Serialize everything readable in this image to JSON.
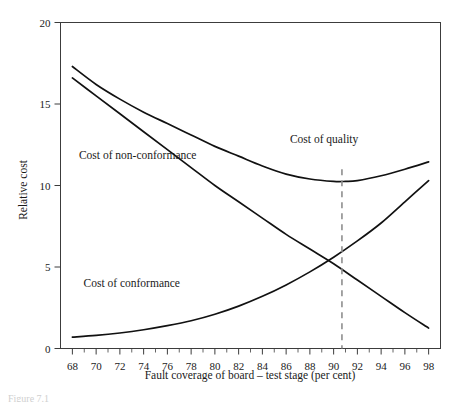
{
  "figure": {
    "caption_fragment": "Figure 7.1"
  },
  "chart_data": {
    "type": "line",
    "title": "",
    "xlabel": "Fault coverage of board – test stage (per cent)",
    "ylabel": "Relative cost",
    "xlim": [
      67,
      99
    ],
    "ylim": [
      0,
      20
    ],
    "xticks": [
      68,
      70,
      72,
      74,
      76,
      78,
      80,
      82,
      84,
      86,
      88,
      90,
      92,
      94,
      96,
      98
    ],
    "xtick_labels": [
      "68",
      "70",
      "72",
      "74",
      "76",
      "78",
      "80",
      "82",
      "84",
      "86",
      "88",
      "90",
      "92",
      "94",
      "96",
      "98"
    ],
    "yticks": [
      0,
      5,
      10,
      15,
      20
    ],
    "ytick_labels": [
      "0",
      "5",
      "10",
      "15",
      "20"
    ],
    "grid": false,
    "legend": "inline-annotations",
    "annotations": [
      {
        "text": "Cost of non-conformance",
        "x": 73.5,
        "y": 11.6
      },
      {
        "text": "Cost of conformance",
        "x": 73.0,
        "y": 3.8
      },
      {
        "text": "Cost of quality",
        "x": 89.2,
        "y": 12.6
      }
    ],
    "marker_line": {
      "label": "optimum fault coverage",
      "x": 90.7,
      "style": "dashed",
      "color": "#8e8e8e"
    },
    "series": [
      {
        "name": "Cost of quality",
        "x": [
          68,
          70,
          72,
          74,
          76,
          78,
          80,
          82,
          84,
          86,
          88,
          90,
          91,
          92,
          94,
          96,
          98
        ],
        "values": [
          17.3,
          16.2,
          15.3,
          14.5,
          13.8,
          13.1,
          12.4,
          11.8,
          11.2,
          10.7,
          10.4,
          10.25,
          10.25,
          10.3,
          10.6,
          11.0,
          11.45
        ]
      },
      {
        "name": "Cost of non-conformance",
        "x": [
          68,
          70,
          72,
          74,
          76,
          78,
          80,
          82,
          84,
          86,
          88,
          90,
          92,
          94,
          96,
          98
        ],
        "values": [
          16.6,
          15.5,
          14.4,
          13.3,
          12.2,
          11.1,
          10.0,
          9.0,
          8.0,
          7.0,
          6.1,
          5.2,
          4.2,
          3.2,
          2.2,
          1.25
        ]
      },
      {
        "name": "Cost of conformance",
        "x": [
          68,
          70,
          72,
          74,
          76,
          78,
          80,
          82,
          84,
          86,
          88,
          90,
          92,
          94,
          96,
          98
        ],
        "values": [
          0.7,
          0.8,
          0.95,
          1.15,
          1.4,
          1.7,
          2.1,
          2.6,
          3.2,
          3.9,
          4.7,
          5.6,
          6.6,
          7.7,
          9.0,
          10.3
        ]
      }
    ],
    "crossing_point": {
      "x": 90.3,
      "y": 5.4
    }
  },
  "colors": {
    "curve": "#111111",
    "axis": "#3c3c3c",
    "marker": "#8e8e8e",
    "background": "#ffffff"
  }
}
